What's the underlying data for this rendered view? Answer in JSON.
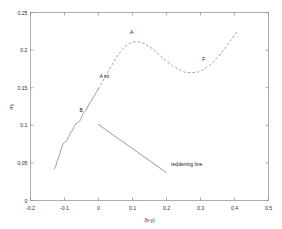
{
  "chart_data": {
    "type": "line",
    "title": "",
    "xlabel": "(b-y)",
    "ylabel": "m₁",
    "xlim": [
      -0.2,
      0.5
    ],
    "ylim": [
      0.0,
      0.25
    ],
    "grid": false,
    "legend_position": "none",
    "xticks": [
      "-0.2",
      "-0.1",
      "0",
      "0.1",
      "0.2",
      "0.3",
      "0.4",
      "0.5"
    ],
    "xtick_values": [
      -0.2,
      -0.1,
      0,
      0.1,
      0.2,
      0.3,
      0.4,
      0.5
    ],
    "yticks": [
      "0",
      "0.05",
      "0.1",
      "0.15",
      "0.2",
      "0.25"
    ],
    "ytick_values": [
      0,
      0.05,
      0.1,
      0.15,
      0.2,
      0.25
    ],
    "series": [
      {
        "name": "main-sequence-observed",
        "style": "solid",
        "color": "#7d7d7d",
        "x": [
          -0.13,
          -0.125,
          -0.121,
          -0.117,
          -0.113,
          -0.11,
          -0.107,
          -0.104,
          -0.101,
          -0.098,
          -0.095,
          -0.092,
          -0.089,
          -0.086,
          -0.083,
          -0.08,
          -0.076,
          -0.073,
          -0.07,
          -0.066,
          -0.063,
          -0.059,
          -0.056,
          -0.052,
          -0.048,
          -0.045,
          -0.041,
          -0.037,
          -0.033,
          -0.029,
          -0.025,
          -0.021,
          -0.017,
          -0.013,
          -0.009,
          -0.005,
          -0.001
        ],
        "y": [
          0.042,
          0.047,
          0.053,
          0.058,
          0.063,
          0.068,
          0.072,
          0.075,
          0.077,
          0.078,
          0.079,
          0.081,
          0.084,
          0.086,
          0.089,
          0.091,
          0.094,
          0.097,
          0.1,
          0.102,
          0.103,
          0.104,
          0.105,
          0.108,
          0.113,
          0.116,
          0.118,
          0.12,
          0.123,
          0.127,
          0.13,
          0.133,
          0.136,
          0.139,
          0.142,
          0.145,
          0.148
        ]
      },
      {
        "name": "main-sequence-interpolated",
        "style": "dashed",
        "color": "#8a8a8a",
        "x": [
          -0.001,
          0.008,
          0.018,
          0.028,
          0.038,
          0.048,
          0.058,
          0.068,
          0.078,
          0.088,
          0.098,
          0.108,
          0.118,
          0.128,
          0.138,
          0.148,
          0.158,
          0.168,
          0.178,
          0.188,
          0.198,
          0.21,
          0.222,
          0.234,
          0.246,
          0.258,
          0.27,
          0.282,
          0.294,
          0.306,
          0.318,
          0.33,
          0.342,
          0.354,
          0.366,
          0.378,
          0.39,
          0.402,
          0.41
        ],
        "y": [
          0.148,
          0.155,
          0.163,
          0.171,
          0.179,
          0.187,
          0.194,
          0.2,
          0.205,
          0.208,
          0.21,
          0.211,
          0.211,
          0.21,
          0.208,
          0.205,
          0.202,
          0.198,
          0.194,
          0.19,
          0.186,
          0.182,
          0.178,
          0.175,
          0.172,
          0.17,
          0.17,
          0.17,
          0.171,
          0.174,
          0.177,
          0.181,
          0.186,
          0.192,
          0.199,
          0.206,
          0.214,
          0.221,
          0.226
        ]
      },
      {
        "name": "reddening-line",
        "style": "solid",
        "color": "#6f6f6f",
        "x": [
          0.0,
          0.2
        ],
        "y": [
          0.101,
          0.037
        ]
      }
    ],
    "annotations": [
      {
        "text": "A",
        "x": 0.093,
        "y": 0.222
      },
      {
        "text": "A int",
        "x": 0.003,
        "y": 0.163
      },
      {
        "text": "B",
        "x": -0.056,
        "y": 0.118
      },
      {
        "text": "F",
        "x": 0.305,
        "y": 0.186
      },
      {
        "text": "reddening line",
        "x": 0.213,
        "y": 0.046
      }
    ]
  }
}
